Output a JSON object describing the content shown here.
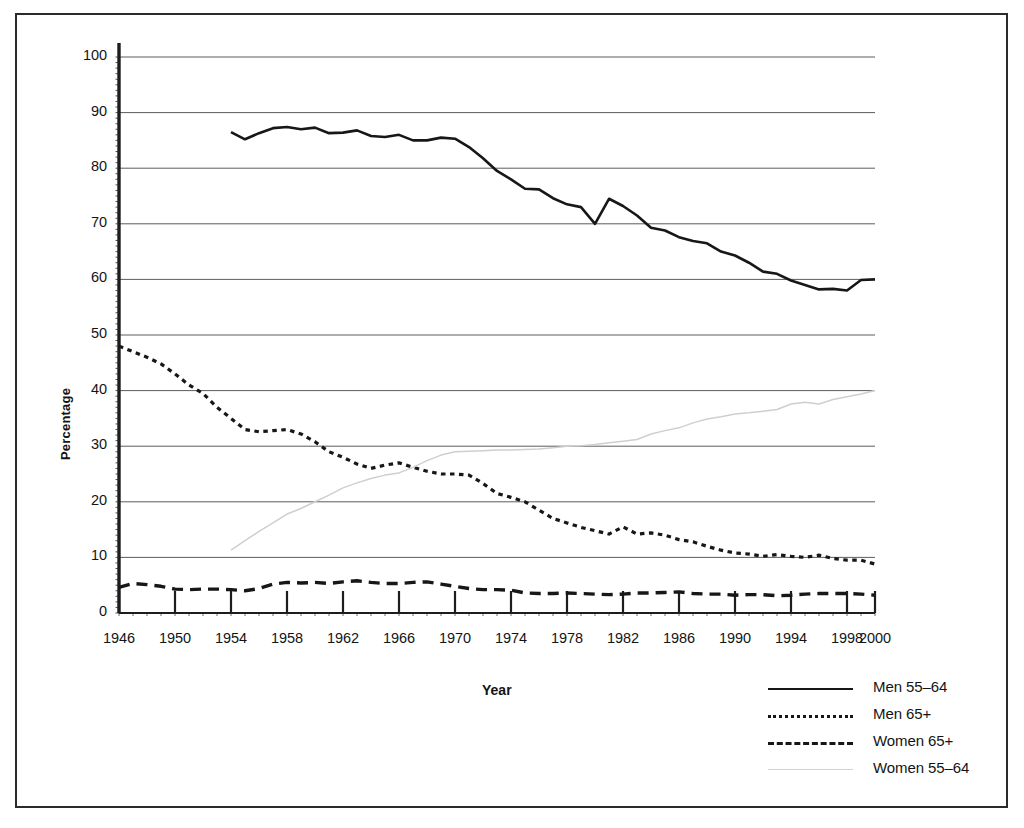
{
  "chart_data": {
    "type": "line",
    "title": "",
    "xlabel": "Year",
    "ylabel": "Percentage",
    "xlim": [
      1946,
      2000
    ],
    "ylim": [
      0,
      100
    ],
    "grid": true,
    "legend_position": "bottom-right",
    "xticks": [
      "1946",
      "1950",
      "1954",
      "1958",
      "1962",
      "1966",
      "1970",
      "1974",
      "1978",
      "1982",
      "1986",
      "1990",
      "1994",
      "1998",
      "2000"
    ],
    "yticks": [
      "0",
      "10",
      "20",
      "30",
      "40",
      "50",
      "60",
      "70",
      "80",
      "90",
      "100"
    ],
    "series": [
      {
        "name": "Men 55–64",
        "style": "solid",
        "color": "#171717",
        "x": [
          1954,
          1955,
          1956,
          1957,
          1958,
          1959,
          1960,
          1961,
          1962,
          1963,
          1964,
          1965,
          1966,
          1967,
          1968,
          1969,
          1970,
          1971,
          1972,
          1973,
          1974,
          1975,
          1976,
          1977,
          1978,
          1979,
          1980,
          1981,
          1982,
          1983,
          1984,
          1985,
          1986,
          1987,
          1988,
          1989,
          1990,
          1991,
          1992,
          1993,
          1994,
          1995,
          1996,
          1997,
          1998,
          1999,
          2000
        ],
        "values": [
          86.5,
          85.2,
          86.3,
          87.2,
          87.4,
          87.0,
          87.3,
          86.3,
          86.4,
          86.8,
          85.8,
          85.6,
          86.0,
          85.0,
          85.0,
          85.5,
          85.3,
          83.8,
          81.8,
          79.5,
          78.0,
          76.3,
          76.2,
          74.6,
          73.5,
          73.0,
          70.0,
          74.5,
          73.2,
          71.5,
          69.3,
          68.8,
          67.6,
          66.9,
          66.5,
          65.0,
          64.3,
          63.0,
          61.4,
          61.0,
          59.8,
          59.0,
          58.2,
          58.3,
          58.0,
          59.9,
          60.0
        ]
      },
      {
        "name": "Men 65+",
        "style": "dotted",
        "color": "#171717",
        "x": [
          1946,
          1947,
          1948,
          1949,
          1950,
          1951,
          1952,
          1953,
          1954,
          1955,
          1956,
          1957,
          1958,
          1959,
          1960,
          1961,
          1962,
          1963,
          1964,
          1965,
          1966,
          1967,
          1968,
          1969,
          1970,
          1971,
          1972,
          1973,
          1974,
          1975,
          1976,
          1977,
          1978,
          1979,
          1980,
          1981,
          1982,
          1983,
          1984,
          1985,
          1986,
          1987,
          1988,
          1989,
          1990,
          1991,
          1992,
          1993,
          1994,
          1995,
          1996,
          1997,
          1998,
          1999,
          2000
        ],
        "values": [
          48.0,
          47.0,
          46.0,
          44.8,
          43.0,
          41.0,
          39.5,
          37.0,
          35.0,
          33.0,
          32.6,
          32.8,
          33.0,
          32.2,
          30.8,
          29.0,
          28.0,
          26.8,
          26.0,
          26.6,
          27.0,
          26.2,
          25.5,
          25.0,
          25.0,
          24.8,
          23.3,
          21.5,
          20.8,
          20.0,
          18.5,
          17.0,
          16.2,
          15.4,
          14.8,
          14.2,
          15.5,
          14.2,
          14.4,
          14.0,
          13.2,
          12.8,
          12.0,
          11.3,
          10.8,
          10.6,
          10.2,
          10.5,
          10.2,
          10.0,
          10.4,
          9.8,
          9.5,
          9.5,
          8.8
        ]
      },
      {
        "name": "Women 65+",
        "style": "dashed",
        "color": "#171717",
        "x": [
          1946,
          1947,
          1948,
          1949,
          1950,
          1951,
          1952,
          1953,
          1954,
          1955,
          1956,
          1957,
          1958,
          1959,
          1960,
          1961,
          1962,
          1963,
          1964,
          1965,
          1966,
          1967,
          1968,
          1969,
          1970,
          1971,
          1972,
          1973,
          1974,
          1975,
          1976,
          1977,
          1978,
          1979,
          1980,
          1981,
          1982,
          1983,
          1984,
          1985,
          1986,
          1987,
          1988,
          1989,
          1990,
          1991,
          1992,
          1993,
          1994,
          1995,
          1996,
          1997,
          1998,
          1999,
          2000
        ],
        "values": [
          4.6,
          5.3,
          5.1,
          4.8,
          4.3,
          4.2,
          4.3,
          4.3,
          4.2,
          4.0,
          4.4,
          5.2,
          5.5,
          5.4,
          5.5,
          5.3,
          5.6,
          5.8,
          5.5,
          5.3,
          5.3,
          5.5,
          5.6,
          5.2,
          4.8,
          4.4,
          4.2,
          4.2,
          4.1,
          3.6,
          3.5,
          3.5,
          3.6,
          3.5,
          3.4,
          3.3,
          3.4,
          3.6,
          3.6,
          3.7,
          3.8,
          3.5,
          3.4,
          3.4,
          3.2,
          3.3,
          3.3,
          3.1,
          3.2,
          3.4,
          3.5,
          3.5,
          3.5,
          3.4,
          3.2
        ]
      },
      {
        "name": "Women 55–64",
        "style": "light",
        "color": "#cfcfcf",
        "x": [
          1954,
          1955,
          1956,
          1957,
          1958,
          1959,
          1960,
          1961,
          1962,
          1963,
          1964,
          1965,
          1966,
          1967,
          1968,
          1969,
          1970,
          1971,
          1972,
          1973,
          1974,
          1975,
          1976,
          1977,
          1978,
          1979,
          1980,
          1981,
          1982,
          1983,
          1984,
          1985,
          1986,
          1987,
          1988,
          1989,
          1990,
          1991,
          1992,
          1993,
          1994,
          1995,
          1996,
          1997,
          1998,
          1999,
          2000
        ],
        "values": [
          11.3,
          13.0,
          14.7,
          16.2,
          17.8,
          18.8,
          20.0,
          21.2,
          22.5,
          23.4,
          24.2,
          24.8,
          25.2,
          26.2,
          27.4,
          28.4,
          29.0,
          29.1,
          29.2,
          29.3,
          29.3,
          29.4,
          29.5,
          29.7,
          30.0,
          30.1,
          30.3,
          30.6,
          30.9,
          31.2,
          32.2,
          32.8,
          33.3,
          34.2,
          34.9,
          35.3,
          35.8,
          36.0,
          36.3,
          36.6,
          37.6,
          37.9,
          37.6,
          38.4,
          38.9,
          39.4,
          40.0
        ]
      }
    ]
  },
  "legend": {
    "items": [
      {
        "label": "Men 55–64",
        "style": "solid"
      },
      {
        "label": "Men 65+",
        "style": "dotted"
      },
      {
        "label": "Women 65+",
        "style": "dashed"
      },
      {
        "label": "Women 55–64",
        "style": "light"
      }
    ]
  }
}
